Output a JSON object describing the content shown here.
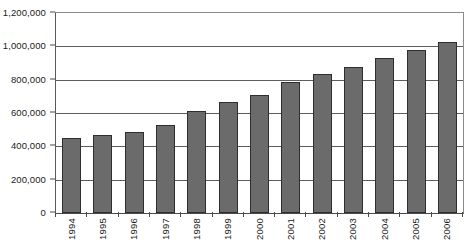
{
  "chart_data": {
    "type": "bar",
    "title": "",
    "subtitle": "",
    "xlabel": "",
    "ylabel": "",
    "categories": [
      "1994",
      "1995",
      "1996",
      "1997",
      "1998",
      "1999",
      "2000",
      "2001",
      "2002",
      "2003",
      "2004",
      "2005",
      "2006"
    ],
    "values": [
      450000,
      470000,
      487000,
      530000,
      615000,
      665000,
      710000,
      785000,
      835000,
      875000,
      930000,
      975000,
      1025000
    ],
    "ylim": [
      0,
      1200000
    ],
    "ytick_values": [
      0,
      200000,
      400000,
      600000,
      800000,
      1000000,
      1200000
    ],
    "ytick_labels": [
      "0",
      "200,000",
      "400,000",
      "600,000",
      "800,000",
      "1,000,000",
      "1,200,000"
    ],
    "grid": true,
    "grid_axis": "y",
    "legend": false,
    "legend_position": "none",
    "bar_color": "#6b6b6b",
    "bar_edge_color": "#2e2e2e",
    "gridline_color": "#5d5d5d",
    "background_color": "#ffffff",
    "xtick_label_rotation": 90
  }
}
